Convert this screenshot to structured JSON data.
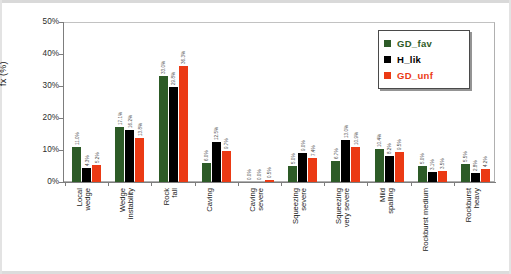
{
  "chart_data": {
    "type": "bar",
    "title": "",
    "xlabel": "",
    "ylabel": "fx (%)",
    "ylim": [
      0,
      50
    ],
    "ytick_labels": [
      "0%",
      "10%",
      "20%",
      "30%",
      "40%",
      "50%"
    ],
    "ytick_values": [
      0,
      10,
      20,
      30,
      40,
      50
    ],
    "grid": false,
    "legend_position": "top-right",
    "categories": [
      "Local wedge",
      "Wedge instability",
      "Rock fall",
      "Caving",
      "Caving severe",
      "Squeezing severe",
      "Squeezing very severe",
      "Mild spalling",
      "Rockburst medium",
      "Rockburst heavy"
    ],
    "category_lines": [
      [
        "Local",
        "wedge"
      ],
      [
        "Wedge",
        "instability"
      ],
      [
        "Rock",
        "fall"
      ],
      [
        "Caving"
      ],
      [
        "Caving",
        "severe"
      ],
      [
        "Squeezing",
        "severe"
      ],
      [
        "Squeezing",
        "very severe"
      ],
      [
        "Mild",
        "spalling"
      ],
      [
        "Rockburst medium"
      ],
      [
        "Rockburst",
        "heavy"
      ]
    ],
    "series": [
      {
        "name": "GD_fav",
        "color": "#2d5b27",
        "values": [
          11.0,
          17.1,
          33.0,
          6.0,
          0.0,
          5.0,
          6.7,
          10.4,
          5.0,
          5.5
        ],
        "labels": [
          "11.0%",
          "17.1%",
          "33.0%",
          "6.0%",
          "0.0%",
          "5.0%",
          "6.7%",
          "10.4%",
          "5.0%",
          "5.5%"
        ]
      },
      {
        "name": "H_lik",
        "color": "#000000",
        "values": [
          4.3,
          16.2,
          29.8,
          12.5,
          0.0,
          9.0,
          13.0,
          8.2,
          3.1,
          2.8
        ],
        "labels": [
          "4.3%",
          "16.2%",
          "29.8%",
          "12.5%",
          "0.0%",
          "9.0%",
          "13.0%",
          "8.2%",
          "3.1%",
          "2.8%"
        ]
      },
      {
        "name": "GD_unf",
        "color": "#eb3a14",
        "values": [
          5.2,
          13.8,
          36.3,
          9.7,
          0.5,
          7.4,
          10.9,
          9.5,
          3.5,
          4.2
        ],
        "labels": [
          "5.2%",
          "13.8%",
          "36.3%",
          "9.7%",
          "0.5%",
          "7.4%",
          "10.9%",
          "9.5%",
          "3.5%",
          "4.2%"
        ]
      }
    ]
  }
}
